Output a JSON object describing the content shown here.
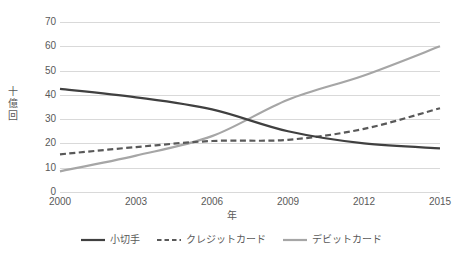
{
  "chart_data": {
    "type": "line",
    "title": "",
    "xlabel": "年",
    "ylabel": "十億回",
    "x": [
      2000,
      2003,
      2006,
      2009,
      2012,
      2015
    ],
    "categories": [
      "2000",
      "2003",
      "2006",
      "2009",
      "2012",
      "2015"
    ],
    "xlim": [
      2000,
      2015
    ],
    "ylim": [
      0,
      70
    ],
    "y_ticks": [
      70,
      60,
      50,
      40,
      30,
      20,
      10,
      0
    ],
    "grid": true,
    "legend_position": "bottom",
    "series": [
      {
        "name": "小切手",
        "color": "#404040",
        "style": "solid",
        "values": [
          42.5,
          39.0,
          34.0,
          25.0,
          20.0,
          18.0
        ]
      },
      {
        "name": "クレジットカード",
        "color": "#595959",
        "style": "dashed",
        "values": [
          15.5,
          18.5,
          21.0,
          21.5,
          26.0,
          34.5
        ]
      },
      {
        "name": "デビットカード",
        "color": "#a6a6a6",
        "style": "solid",
        "values": [
          8.5,
          15.0,
          23.0,
          38.0,
          48.0,
          60.0
        ]
      }
    ]
  },
  "axes": {
    "y_tick_labels": [
      "70",
      "60",
      "50",
      "40",
      "30",
      "20",
      "10",
      "0"
    ],
    "x_tick_labels": [
      "2000",
      "2003",
      "2006",
      "2009",
      "2012",
      "2015"
    ],
    "y_title_chars": [
      "十",
      "億",
      "回"
    ],
    "x_title": "年"
  },
  "legend": {
    "items": [
      {
        "label": "小切手",
        "color": "#404040",
        "style": "solid"
      },
      {
        "label": "クレジットカード",
        "color": "#595959",
        "style": "dashed"
      },
      {
        "label": "デビットカード",
        "color": "#a6a6a6",
        "style": "solid"
      }
    ]
  },
  "colors": {
    "grid": "#d9d9d9",
    "text": "#595959",
    "background": "#ffffff",
    "series_check": "#404040",
    "series_credit": "#595959",
    "series_debit": "#a6a6a6"
  }
}
